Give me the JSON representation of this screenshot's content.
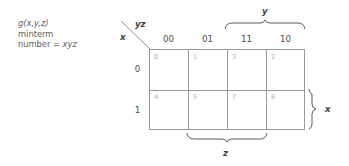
{
  "figure": {
    "caption": {
      "line1": "g(x,y,z)",
      "line2": "minterm",
      "line3": "number = xyz"
    },
    "corner": {
      "top_right_label": "yz",
      "bottom_left_label": "x"
    },
    "column_headers": [
      "00",
      "01",
      "11",
      "10"
    ],
    "row_headers": [
      "0",
      "1"
    ],
    "cells": [
      [
        "0",
        "1",
        "3",
        "2"
      ],
      [
        "4",
        "5",
        "7",
        "6"
      ]
    ],
    "braces": [
      {
        "id": "y",
        "label": "y",
        "spans_columns": [
          "11",
          "10"
        ],
        "position": "top"
      },
      {
        "id": "z",
        "label": "z",
        "spans_columns": [
          "01",
          "11"
        ],
        "position": "bottom"
      },
      {
        "id": "x",
        "label": "x",
        "spans_rows": [
          "1"
        ],
        "position": "right"
      }
    ],
    "colors": {
      "grid_line": "#9a9a9a",
      "cell_number": "#b2b2b2",
      "header_text": "#4a4a4a",
      "caption_text": "#5d5d5d",
      "brace": "#5a5a5a",
      "background": "#ffffff"
    }
  }
}
